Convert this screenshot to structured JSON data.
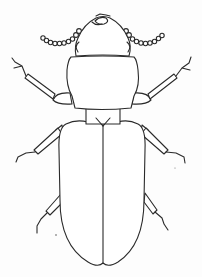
{
  "figure": {
    "subject": "beetle line drawing (dorsal view)",
    "caption": "",
    "colors": {
      "ink": "#2a2a2a",
      "paper": "#fdfdfd"
    }
  }
}
